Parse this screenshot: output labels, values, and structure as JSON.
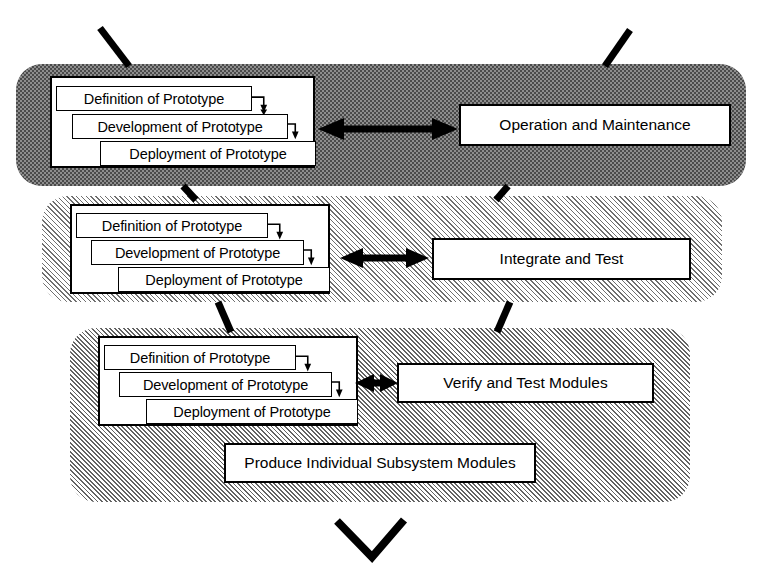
{
  "diagram": {
    "colors": {
      "ink": "#000000",
      "band1_fill": "#8d8d8d",
      "band2_fill": "#e8e8e8",
      "band3_fill": "#e0e0e0",
      "box_fill": "#ffffff"
    },
    "prototype_cycle": {
      "steps": [
        {
          "label": "Definition of Prototype"
        },
        {
          "label": "Development  of Prototype"
        },
        {
          "label": "Deployment  of Prototype"
        }
      ]
    },
    "bands": [
      {
        "name": "system-level-band",
        "texture": "checkerboard-dark",
        "prototype_steps": [
          "Definition of Prototype",
          "Development  of Prototype",
          "Deployment  of Prototype"
        ],
        "activities": [
          {
            "label": "Operation and Maintenance"
          }
        ],
        "link_arrow": "bidirectional"
      },
      {
        "name": "subsystem-level-band",
        "texture": "diagonal-hatch-light",
        "prototype_steps": [
          "Definition of Prototype",
          "Development  of Prototype",
          "Deployment  of Prototype"
        ],
        "activities": [
          {
            "label": "Integrate and Test"
          }
        ],
        "link_arrow": "bidirectional"
      },
      {
        "name": "module-level-band",
        "texture": "diagonal-hatch-medium",
        "prototype_steps": [
          "Definition of Prototype",
          "Development  of Prototype",
          "Deployment  of Prototype"
        ],
        "activities": [
          {
            "label": "Verify and Test Modules"
          },
          {
            "label": "Produce Individual Subsystem Modules"
          }
        ],
        "link_arrow": "bidirectional"
      }
    ],
    "connectors": {
      "top_left_stroke": "descending-v-left-arm",
      "top_right_stroke": "descending-v-right-arm",
      "band1_to_band2_left": "v-left-arm",
      "band1_to_band2_right": "v-right-arm",
      "band2_to_band3_left": "v-left-arm",
      "band2_to_band3_right": "v-right-arm",
      "bottom_chevron": "v-apex"
    }
  }
}
